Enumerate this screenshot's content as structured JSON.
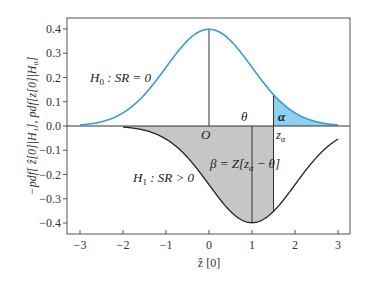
{
  "chart_data": {
    "type": "line",
    "title": "",
    "xlabel": "ẑ [0]",
    "ylabel": "−pdf[ ẑ[0]|H₁], pdf[z[0]|H₀]",
    "xlim": [
      -3,
      3
    ],
    "ylim": [
      -0.43,
      0.43
    ],
    "x_ticks": [
      -3,
      -2,
      -1,
      0,
      1,
      2,
      3
    ],
    "x_tick_labels": [
      "−3",
      "−2",
      "−1",
      "0",
      "1",
      "2",
      "3"
    ],
    "y_ticks": [
      0.4,
      0.3,
      0.2,
      0.1,
      0.0,
      -0.1,
      -0.2,
      -0.3,
      -0.4
    ],
    "y_tick_labels": [
      "0.4",
      "0.3",
      "0.2",
      "0.1",
      "0.0",
      "−0.1",
      "−0.2",
      "−0.3",
      "−0.4"
    ],
    "grid": false,
    "legend": "none",
    "series": [
      {
        "name": "H0: SR = 0",
        "description": "standard normal pdf, mean 0, sd 1",
        "mean": 0,
        "sd": 1,
        "sign": 1,
        "x_range": [
          -3,
          3
        ],
        "color": "#3a9ad9",
        "x": [
          -3,
          -2,
          -1,
          0,
          1,
          1.5,
          2,
          3
        ],
        "values": [
          0.004,
          0.054,
          0.242,
          0.399,
          0.242,
          0.13,
          0.054,
          0.004
        ]
      },
      {
        "name": "H1: SR > 0",
        "description": "negated normal pdf, mean 1 (θ), sd 1",
        "mean": 1,
        "sd": 1,
        "sign": -1,
        "x_range": [
          -2,
          3
        ],
        "color": "#222222",
        "x": [
          -2,
          -1,
          0,
          1,
          1.5,
          2,
          3
        ],
        "values": [
          -0.004,
          -0.054,
          -0.242,
          -0.399,
          -0.352,
          -0.242,
          -0.054
        ]
      }
    ],
    "shaded_regions": [
      {
        "name": "alpha",
        "under": "H0",
        "from": 1.5,
        "to": 3,
        "color": "#8fd0ee"
      },
      {
        "name": "beta",
        "under": "H1",
        "from": -2,
        "to": 1.5,
        "color": "#c6c6c6"
      }
    ],
    "vertical_lines": [
      {
        "name": "O",
        "x": 0
      },
      {
        "name": "theta",
        "x": 1
      },
      {
        "name": "z_alpha",
        "x": 1.5
      }
    ],
    "annotations": [
      {
        "text": "H₀ : SR = 0",
        "x": -2.8,
        "y": 0.2
      },
      {
        "text": "H₁ : SR > 0",
        "x": -1.8,
        "y": -0.21
      },
      {
        "text": "O",
        "x": -0.05,
        "y": -0.03
      },
      {
        "text": "θ",
        "x": 0.9,
        "y": 0.025
      },
      {
        "text": "α",
        "x": 1.6,
        "y": 0.025
      },
      {
        "text": "zα",
        "x": 1.55,
        "y": -0.035
      },
      {
        "text": "β = Z[zα − θ]",
        "x": 0.0,
        "y": -0.15
      }
    ]
  },
  "labels": {
    "h0": "H",
    "h0_sub": "0",
    "h0_rest": " : SR = 0",
    "h1": "H",
    "h1_sub": "1",
    "h1_rest": " : SR > 0",
    "origin": "O",
    "theta": "θ",
    "alpha": "α",
    "z_alpha": "z",
    "z_alpha_sub": "α",
    "beta_eq": "β = Z[z",
    "beta_sub": "α",
    "beta_rest": " − θ]",
    "xlabel": "ẑ [0]",
    "ylabel": "−pdf[ ẑ[0]|H₁], pdf[z[0]|H₀]"
  }
}
